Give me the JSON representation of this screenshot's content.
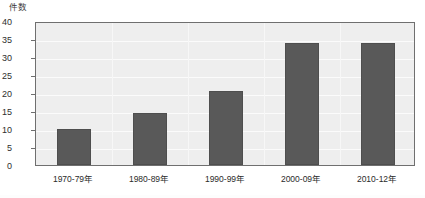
{
  "chart_data": {
    "type": "bar",
    "title": "",
    "subtitle": "",
    "xlabel": "",
    "ylabel": "件数",
    "categories": [
      "1970-79年",
      "1980-89年",
      "1990-99年",
      "2000-09年",
      "2010-12年"
    ],
    "values": [
      10,
      14.5,
      20.5,
      34,
      34
    ],
    "series": [
      {
        "name": "件数",
        "values": [
          10,
          14.5,
          20.5,
          34,
          34
        ]
      }
    ],
    "ylim": [
      0,
      40
    ],
    "ytick_labels": [
      "0",
      "5",
      "10",
      "15",
      "20",
      "25",
      "30",
      "35",
      "40"
    ],
    "ytick_values": [
      0,
      5,
      10,
      15,
      20,
      25,
      30,
      35,
      40
    ],
    "grid": true,
    "grid_orientation": "both",
    "legend": false,
    "legend_position": "none",
    "annotations": [],
    "colors": {
      "bar_fill": "#595959",
      "bar_stroke": "#4e4e4e",
      "plot_background": "#eeeeee",
      "gridline": "#fbfbfb",
      "axis_line": "#6f6f6f",
      "text": "#2b2b2b",
      "page_background": "#ffffff"
    }
  }
}
